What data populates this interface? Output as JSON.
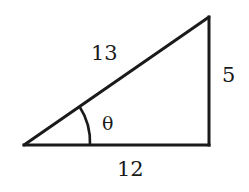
{
  "diagram": {
    "type": "right-triangle",
    "stroke_color": "#1a1a1a",
    "background": "#ffffff",
    "vertices": {
      "left": [
        24,
        145
      ],
      "right_angle": [
        209,
        145
      ],
      "top": [
        209,
        17
      ]
    },
    "sides": {
      "hypotenuse": {
        "label": "13"
      },
      "opposite": {
        "label": "5"
      },
      "adjacent": {
        "label": "12"
      }
    },
    "angle": {
      "label": "θ",
      "vertex": "left"
    }
  }
}
